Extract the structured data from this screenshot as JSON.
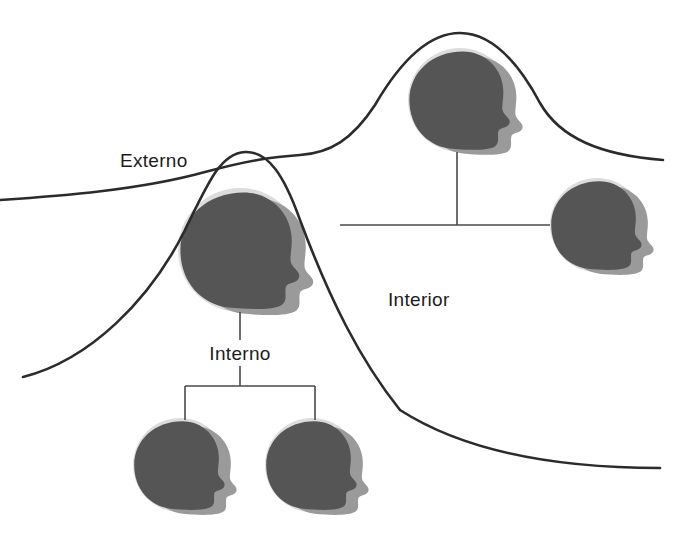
{
  "diagram": {
    "type": "conceptual-diagram",
    "background_color": "#ffffff",
    "title": "",
    "labels": {
      "externo": "Externo",
      "interior": "Interior",
      "interno": "Interno"
    },
    "colors": {
      "curve_stroke": "#2b2b2b",
      "connector_stroke": "#4a4a4a",
      "label_text": "#1c1c1c",
      "icon_circle_bg": "#dcdcdc",
      "icon_head_dark": "#555555",
      "icon_head_shadow": "#9a9a9a"
    },
    "curves": [
      {
        "name": "outer-curve",
        "description": "left rising curve forming the left hump and descending to lower right",
        "path": "M 23 377 C 90 360 150 300 185 230 C 210 178 222 153 245 152 C 268 151 284 175 300 220 C 330 300 360 360 400 410 C 470 455 570 468 660 468"
      },
      {
        "name": "inner-curve",
        "description": "curve forming the right taller hump, crossing the left curve at the valley",
        "path": "M 0 200 C 60 196 140 190 205 172 C 250 160 272 157 300 155 C 330 153 352 140 375 105 C 400 62 428 33 460 33 C 492 33 518 62 540 103 C 560 138 600 155 663 160"
      }
    ],
    "icons": [
      {
        "name": "head-icon-main",
        "cx": 240,
        "cy": 250,
        "r": 62,
        "role": "central-person"
      },
      {
        "name": "head-icon-top",
        "cx": 460,
        "cy": 100,
        "r": 52,
        "role": "external-person-1"
      },
      {
        "name": "head-icon-right",
        "cx": 597,
        "cy": 225,
        "r": 47,
        "role": "external-person-2"
      },
      {
        "name": "head-icon-bottom-left",
        "cx": 180,
        "cy": 465,
        "r": 47,
        "role": "internal-person-1"
      },
      {
        "name": "head-icon-bottom-right",
        "cx": 312,
        "cy": 465,
        "r": 47,
        "role": "internal-person-2"
      }
    ],
    "connectors": {
      "externo_branch": {
        "trunk": "M 457 152 L 457 225",
        "bar": "M 340 225 L 550 225"
      },
      "interno_branch": {
        "trunk_upper": "M 240 312 L 240 340",
        "trunk_lower": "M 240 366 L 240 386",
        "bar": "M 185 386 L 315 386",
        "leg_left": "M 185 386 L 185 420",
        "leg_right": "M 315 386 L 315 420"
      }
    },
    "label_positions": {
      "externo": {
        "x": 120,
        "y": 167,
        "anchor": "start"
      },
      "interior": {
        "x": 388,
        "y": 306,
        "anchor": "start"
      },
      "interno": {
        "x": 240,
        "y": 360,
        "anchor": "middle"
      }
    }
  }
}
